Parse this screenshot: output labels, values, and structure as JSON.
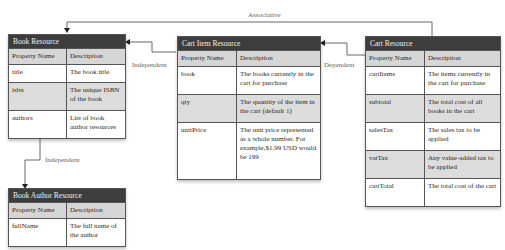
{
  "diagram": {
    "associations": {
      "associative": "Associative",
      "independent_1": "Independent",
      "dependent": "Dependent",
      "independent_2": "Independent"
    },
    "tables": {
      "book": {
        "title": "Book Resource",
        "headers": [
          "Property Name",
          "Description"
        ],
        "rows": [
          {
            "name": "title",
            "desc": "The book title"
          },
          {
            "name": "isbn",
            "desc": "The unique ISBN of the book"
          },
          {
            "name": "authors",
            "desc": "List of book author resources"
          }
        ]
      },
      "author": {
        "title": "Book Author Resource",
        "headers": [
          "Property Name",
          "Description"
        ],
        "rows": [
          {
            "name": "fullName",
            "desc": "The full name of the author"
          }
        ]
      },
      "cartItem": {
        "title": "Cart Item Resource",
        "headers": [
          "Property Name",
          "Description"
        ],
        "rows": [
          {
            "name": "book",
            "desc": "The books currently in the cart for purchase"
          },
          {
            "name": "qty",
            "desc": "The quantity of the item in the cart (default 1)"
          },
          {
            "name": "unitPrice",
            "desc": "The unit price represented as a whole number. For example,$1.99 USD would be 199"
          }
        ]
      },
      "cart": {
        "title": "Cart Resource",
        "headers": [
          "Property Name",
          "Description"
        ],
        "rows": [
          {
            "name": "cartItems",
            "desc": "The items currently in the cart for purchase"
          },
          {
            "name": "subtotal",
            "desc": "The total cost of all books in the cart"
          },
          {
            "name": "salesTax",
            "desc": "The sales tax to be applied"
          },
          {
            "name": "vatTax",
            "desc": "Any value-added tax to be applied"
          },
          {
            "name": "cartTotal",
            "desc": "The total cost of the cart"
          }
        ]
      }
    }
  }
}
